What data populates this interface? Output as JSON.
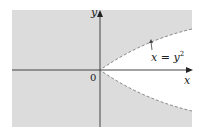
{
  "figure": {
    "type": "region-plot",
    "axis_labels": {
      "x": "x",
      "y": "y"
    },
    "origin_label": "0",
    "curve": {
      "equation": "x = y²",
      "lhs": "x",
      "eq": "=",
      "rhs_base": "y",
      "rhs_exp": "2",
      "style": "dashed",
      "color": "#8a8a8a"
    },
    "shaded_region": {
      "description": "region outside parabola x = y² (x < y²)",
      "color": "#dcdcdc"
    },
    "axis_color": "#444444"
  }
}
